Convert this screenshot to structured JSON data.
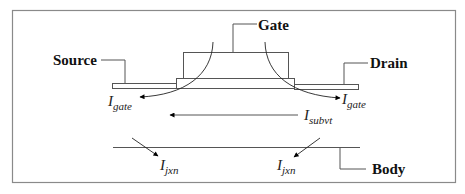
{
  "diagram": {
    "terminals": {
      "source": "Source",
      "gate": "Gate",
      "drain": "Drain",
      "body": "Body"
    },
    "currents": {
      "gate_left": {
        "main": "I",
        "sub": "gate"
      },
      "gate_right": {
        "main": "I",
        "sub": "gate"
      },
      "subvt": {
        "main": "I",
        "sub": "subvt"
      },
      "jxn_left": {
        "main": "I",
        "sub": "jxn"
      },
      "jxn_right": {
        "main": "I",
        "sub": "jxn"
      }
    },
    "colors": {
      "frame": "#8a8a8a",
      "line": "#555555",
      "arrow": "#000000",
      "text": "#111111"
    }
  }
}
